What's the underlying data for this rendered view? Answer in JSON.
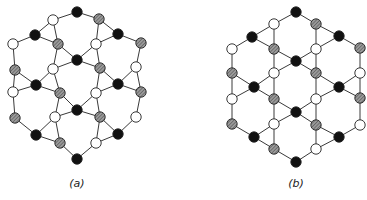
{
  "figure": {
    "panels": [
      {
        "id": "a",
        "label": "(a)",
        "label_pos": [
          77,
          187
        ],
        "node_radius": 5.2,
        "nodes": [
          [
            77,
            12,
            "black"
          ],
          [
            53,
            20,
            "white"
          ],
          [
            99,
            19,
            "hatched"
          ],
          [
            35,
            35,
            "black"
          ],
          [
            118,
            34,
            "black"
          ],
          [
            13,
            44,
            "white"
          ],
          [
            58,
            44,
            "hatched"
          ],
          [
            96,
            44,
            "white"
          ],
          [
            141,
            43,
            "hatched"
          ],
          [
            77,
            60,
            "black"
          ],
          [
            15,
            70,
            "hatched"
          ],
          [
            53,
            69,
            "white"
          ],
          [
            100,
            68,
            "hatched"
          ],
          [
            136,
            67,
            "white"
          ],
          [
            36,
            85,
            "black"
          ],
          [
            118,
            84,
            "black"
          ],
          [
            13,
            92,
            "white"
          ],
          [
            60,
            93,
            "hatched"
          ],
          [
            96,
            93,
            "white"
          ],
          [
            141,
            92,
            "hatched"
          ],
          [
            77,
            110,
            "black"
          ],
          [
            15,
            118,
            "hatched"
          ],
          [
            55,
            117,
            "white"
          ],
          [
            100,
            117,
            "hatched"
          ],
          [
            136,
            117,
            "white"
          ],
          [
            36,
            135,
            "black"
          ],
          [
            118,
            134,
            "black"
          ],
          [
            60,
            143,
            "hatched"
          ],
          [
            96,
            143,
            "white"
          ],
          [
            77,
            159,
            "black"
          ]
        ],
        "edges": [
          [
            0,
            1
          ],
          [
            0,
            2
          ],
          [
            1,
            3
          ],
          [
            1,
            6
          ],
          [
            3,
            5
          ],
          [
            3,
            6
          ],
          [
            2,
            4
          ],
          [
            2,
            7
          ],
          [
            4,
            8
          ],
          [
            4,
            7
          ],
          [
            5,
            10
          ],
          [
            6,
            9
          ],
          [
            6,
            11
          ],
          [
            7,
            9
          ],
          [
            7,
            12
          ],
          [
            8,
            13
          ],
          [
            9,
            11
          ],
          [
            9,
            12
          ],
          [
            10,
            14
          ],
          [
            10,
            16
          ],
          [
            11,
            14
          ],
          [
            11,
            17
          ],
          [
            12,
            15
          ],
          [
            12,
            18
          ],
          [
            13,
            15
          ],
          [
            13,
            19
          ],
          [
            14,
            16
          ],
          [
            14,
            17
          ],
          [
            15,
            18
          ],
          [
            15,
            19
          ],
          [
            16,
            21
          ],
          [
            17,
            20
          ],
          [
            17,
            22
          ],
          [
            18,
            20
          ],
          [
            18,
            23
          ],
          [
            19,
            24
          ],
          [
            20,
            22
          ],
          [
            20,
            23
          ],
          [
            21,
            25
          ],
          [
            22,
            25
          ],
          [
            22,
            27
          ],
          [
            23,
            26
          ],
          [
            23,
            28
          ],
          [
            24,
            26
          ],
          [
            25,
            27
          ],
          [
            26,
            28
          ],
          [
            27,
            29
          ],
          [
            28,
            29
          ]
        ]
      },
      {
        "id": "b",
        "label": "(b)",
        "label_pos": [
          296,
          187
        ],
        "node_radius": 5.2,
        "nodes": [
          [
            296,
            12,
            "black"
          ],
          [
            274,
            24,
            "white"
          ],
          [
            316,
            24,
            "hatched"
          ],
          [
            252,
            37,
            "black"
          ],
          [
            339,
            36,
            "black"
          ],
          [
            232,
            49,
            "white"
          ],
          [
            274,
            49,
            "hatched"
          ],
          [
            316,
            49,
            "white"
          ],
          [
            360,
            48,
            "hatched"
          ],
          [
            296,
            61,
            "black"
          ],
          [
            232,
            73,
            "hatched"
          ],
          [
            274,
            73,
            "white"
          ],
          [
            316,
            73,
            "hatched"
          ],
          [
            360,
            73,
            "white"
          ],
          [
            254,
            87,
            "black"
          ],
          [
            339,
            87,
            "black"
          ],
          [
            232,
            99,
            "white"
          ],
          [
            274,
            99,
            "hatched"
          ],
          [
            316,
            99,
            "white"
          ],
          [
            360,
            98,
            "hatched"
          ],
          [
            296,
            112,
            "black"
          ],
          [
            232,
            124,
            "hatched"
          ],
          [
            274,
            124,
            "white"
          ],
          [
            316,
            125,
            "hatched"
          ],
          [
            360,
            125,
            "white"
          ],
          [
            254,
            137,
            "black"
          ],
          [
            339,
            137,
            "black"
          ],
          [
            274,
            149,
            "hatched"
          ],
          [
            316,
            149,
            "white"
          ],
          [
            296,
            162,
            "black"
          ]
        ],
        "edges": [
          [
            0,
            1
          ],
          [
            0,
            2
          ],
          [
            1,
            3
          ],
          [
            1,
            6
          ],
          [
            2,
            4
          ],
          [
            2,
            7
          ],
          [
            3,
            5
          ],
          [
            3,
            6
          ],
          [
            4,
            7
          ],
          [
            4,
            8
          ],
          [
            5,
            10
          ],
          [
            6,
            9
          ],
          [
            6,
            11
          ],
          [
            7,
            9
          ],
          [
            7,
            12
          ],
          [
            8,
            13
          ],
          [
            9,
            11
          ],
          [
            9,
            12
          ],
          [
            10,
            14
          ],
          [
            10,
            16
          ],
          [
            11,
            14
          ],
          [
            11,
            17
          ],
          [
            12,
            15
          ],
          [
            12,
            18
          ],
          [
            13,
            15
          ],
          [
            13,
            19
          ],
          [
            14,
            16
          ],
          [
            14,
            17
          ],
          [
            15,
            18
          ],
          [
            15,
            19
          ],
          [
            16,
            21
          ],
          [
            17,
            20
          ],
          [
            17,
            22
          ],
          [
            18,
            20
          ],
          [
            18,
            23
          ],
          [
            19,
            24
          ],
          [
            20,
            22
          ],
          [
            20,
            23
          ],
          [
            21,
            25
          ],
          [
            22,
            25
          ],
          [
            22,
            27
          ],
          [
            23,
            26
          ],
          [
            23,
            28
          ],
          [
            24,
            26
          ],
          [
            25,
            27
          ],
          [
            26,
            28
          ],
          [
            27,
            29
          ],
          [
            28,
            29
          ]
        ]
      }
    ],
    "colors": {
      "black_node": "#111111",
      "white_node": "#ffffff",
      "hatched_bg": "#9a9a9a",
      "hatched_line": "#444444",
      "edge": "#3a3a3a"
    }
  }
}
